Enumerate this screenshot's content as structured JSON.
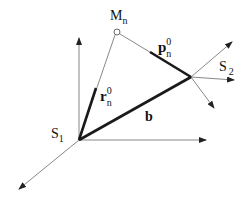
{
  "diagram": {
    "labels": {
      "M": {
        "base": "M",
        "sub": "n"
      },
      "p": {
        "base": "p",
        "sup": "0",
        "sub": "n"
      },
      "r": {
        "base": "r",
        "sup": "0",
        "sub": "n"
      },
      "S1": {
        "base": "S",
        "sub": "1"
      },
      "S2": {
        "base": "S",
        "sub": "2"
      },
      "b": {
        "base": "b"
      }
    },
    "points": {
      "S1_origin": [
        79,
        140
      ],
      "S2_point": [
        191,
        77
      ],
      "M_n": [
        117,
        32
      ]
    },
    "colors": {
      "thin_line": "#888888",
      "bold_vector": "#1a1a1a",
      "text": "#111111"
    }
  }
}
